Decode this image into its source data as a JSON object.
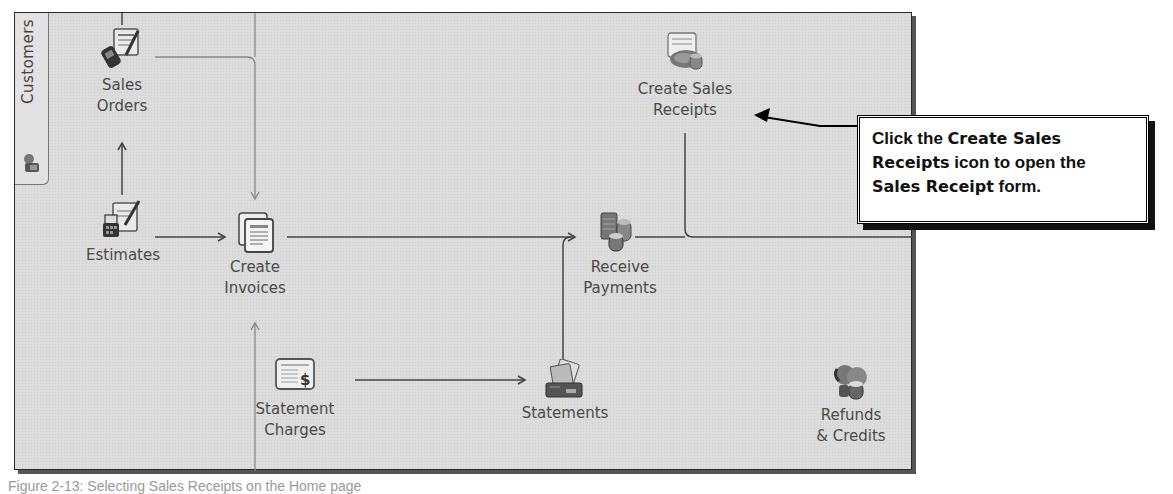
{
  "sidebar": {
    "tab_label": "Customers",
    "tab_icon": "customers-icon"
  },
  "nodes": {
    "sales_orders": {
      "label": "Sales\nOrders",
      "icon": "sales-orders-icon"
    },
    "estimates": {
      "label": "Estimates",
      "icon": "estimates-icon"
    },
    "create_invoices": {
      "label": "Create\nInvoices",
      "icon": "create-invoices-icon"
    },
    "create_sales_receipts": {
      "label": "Create Sales\nReceipts",
      "icon": "create-sales-receipts-icon"
    },
    "receive_payments": {
      "label": "Receive\nPayments",
      "icon": "receive-payments-icon"
    },
    "statement_charges": {
      "label": "Statement\nCharges",
      "icon": "statement-charges-icon"
    },
    "statements": {
      "label": "Statements",
      "icon": "statements-icon"
    },
    "refunds_credits": {
      "label": "Refunds\n& Credits",
      "icon": "refunds-credits-icon"
    }
  },
  "callout": {
    "part1": "Click the ",
    "part2": "Create Sales Receipts",
    "part3": " icon to open the ",
    "part4": "Sales Receipt",
    "part5": " form."
  },
  "caption": "Figure 2-13: Selecting Sales Receipts on the Home page",
  "colors": {
    "panel_bg": "#dcdcdc",
    "text": "#4a4a4a",
    "line": "#555555",
    "callout_border": "#000000"
  }
}
